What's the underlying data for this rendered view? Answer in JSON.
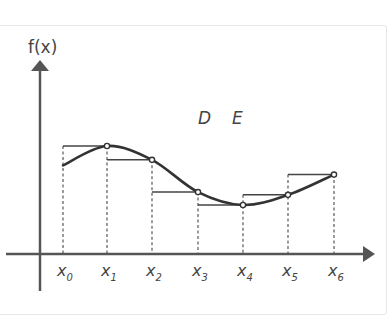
{
  "diagram": {
    "y_axis_label": "f(x)",
    "point_labels": [
      "D",
      "E"
    ],
    "x_labels": [
      {
        "base": "x",
        "sub": "0"
      },
      {
        "base": "x",
        "sub": "1"
      },
      {
        "base": "x",
        "sub": "2"
      },
      {
        "base": "x",
        "sub": "3"
      },
      {
        "base": "x",
        "sub": "4"
      },
      {
        "base": "x",
        "sub": "5"
      },
      {
        "base": "x",
        "sub": "6"
      }
    ],
    "f_values": [
      0.79,
      1.0,
      0.85,
      0.5,
      0.36,
      0.47,
      0.69
    ],
    "rect_heights": [
      1.0,
      0.85,
      0.5,
      0.36,
      0.47,
      0.69
    ],
    "colors": {
      "axis": "#555555",
      "curve": "#333333",
      "dashed": "#666666",
      "rect": "#444444",
      "label": "#444444"
    }
  }
}
